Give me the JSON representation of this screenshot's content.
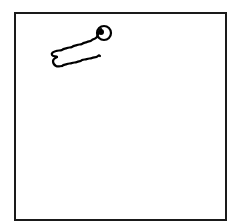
{
  "sketch": {
    "description": "Hand-drawn sketch of a worm/caterpillar with a large eye inside a square frame",
    "frame": {
      "stroke_color": "#1a1a1a",
      "background": "#ffffff"
    },
    "figure": {
      "label": "worm",
      "stroke_color": "#000000",
      "eye": {
        "cx": 104,
        "cy": 33,
        "r": 7,
        "pupil_cx": 101,
        "pupil_cy": 32,
        "pupil_r": 3
      }
    }
  }
}
